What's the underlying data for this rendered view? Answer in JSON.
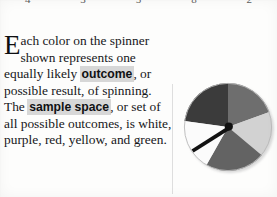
{
  "page": {
    "background_color": "#fdfdfc",
    "top_number_row": {
      "clipped": true,
      "numbers": [
        "4",
        "3",
        "5",
        "8",
        "2"
      ]
    },
    "body": {
      "dropcap": "E",
      "segments": [
        {
          "text": "ach color on the spinner shown represents one equally likely ",
          "style": "normal"
        },
        {
          "text": "outcome",
          "style": "highlighted-term"
        },
        {
          "text": ", or possible result, of spinning. The ",
          "style": "normal"
        },
        {
          "text": "sample space",
          "style": "highlighted-term"
        },
        {
          "text": ", or set of all possible outcomes, is white, purple, red, yellow, and green.",
          "style": "normal"
        }
      ],
      "full_text": "Each color on the spinner shown represents one equally likely outcome, or possible result, of spinning. The sample space, or set of all possible outcomes, is white, purple, red, yellow, and green.",
      "terms": [
        "outcome",
        "sample space"
      ],
      "highlight_color": "#d7d7d7",
      "text_color": "#16171a"
    },
    "figure": {
      "name": "spinner",
      "shape": "circle",
      "sections": 5,
      "needle": {
        "present": true,
        "points_toward": "white",
        "direction_degrees": 205
      },
      "hub_color": "#111111",
      "wedges": [
        {
          "label": "purple",
          "render_gray": "#3b3b3b",
          "start_deg": 188,
          "end_deg": 270
        },
        {
          "label": "red",
          "render_gray": "#6e6e6e",
          "start_deg": 270,
          "end_deg": 340
        },
        {
          "label": "yellow",
          "render_gray": "#d2d2d2",
          "start_deg": 340,
          "end_deg": 40
        },
        {
          "label": "green",
          "render_gray": "#636363",
          "start_deg": 40,
          "end_deg": 120
        },
        {
          "label": "white",
          "render_gray": "#fbfbfb",
          "start_deg": 120,
          "end_deg": 188
        }
      ]
    }
  }
}
